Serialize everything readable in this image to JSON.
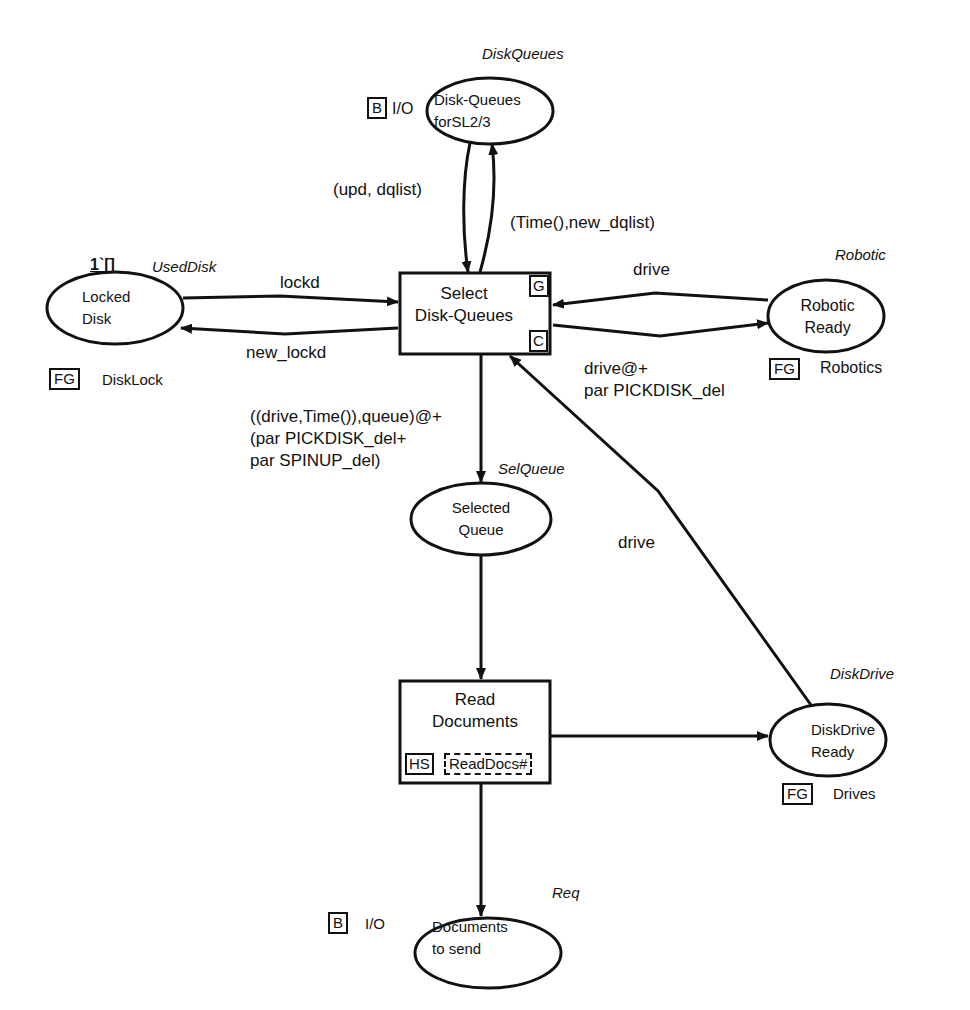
{
  "places": {
    "disk_queues": {
      "name": "Disk-Queues\nforSL2/3",
      "line1": "Disk-Queues",
      "line2": "forSL2/3",
      "colorset": "DiskQueues",
      "port_tag": "B",
      "port_label": "I/O"
    },
    "locked_disk": {
      "line1": "Locked",
      "line2": "Disk",
      "colorset": "UsedDisk",
      "initial_marking": "1`[]",
      "fusion_tag": "FG",
      "fusion_label": "DiskLock"
    },
    "robotic_ready": {
      "line1": "Robotic",
      "line2": "Ready",
      "colorset": "Robotic",
      "fusion_tag": "FG",
      "fusion_label": "Robotics"
    },
    "selected_queue": {
      "line1": "Selected",
      "line2": "Queue",
      "colorset": "SelQueue"
    },
    "diskdrive_ready": {
      "line1": "DiskDrive",
      "line2": "Ready",
      "colorset": "DiskDrive",
      "fusion_tag": "FG",
      "fusion_label": "Drives"
    },
    "documents_to_send": {
      "line1": "Documents",
      "line2": "to send",
      "colorset": "Req",
      "port_tag": "B",
      "port_label": "I/O"
    }
  },
  "transitions": {
    "select_disk_queues": {
      "line1": "Select",
      "line2": "Disk-Queues",
      "guard_tag": "G",
      "code_tag": "C"
    },
    "read_documents": {
      "line1": "Read",
      "line2": "Documents",
      "hs_tag": "HS",
      "subpage": "ReadDocs#"
    }
  },
  "arcs": {
    "dq_to_select": "(upd, dqlist)",
    "select_to_dq": "(Time(),new_dqlist)",
    "locked_to_select": "lockd",
    "select_to_locked": "new_lockd",
    "robotic_to_select": "drive",
    "select_to_robotic_1": "drive@+",
    "select_to_robotic_2": "par PICKDISK_del",
    "select_to_selq_1": "((drive,Time()),queue)@+",
    "select_to_selq_2": "(par PICKDISK_del+",
    "select_to_selq_3": "par SPINUP_del)",
    "diskdrive_to_select": "drive"
  },
  "colors": {
    "ink": "#111111",
    "background": "#ffffff"
  }
}
